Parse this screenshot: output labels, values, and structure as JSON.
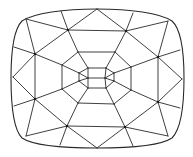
{
  "diagram": {
    "colors": {
      "line": "#2a2a2a",
      "background": "#ffffff"
    },
    "outline": {
      "path": "M 97 9 C 130 9 160 13 172 21 C 182 30 184 55 184 78 C 184 104 182 128 172 138 C 160 146 130 148 97 148 C 64 148 34 146 22 138 C 13 129 11 104 11 78 C 11 54 13 30 22 21 C 34 13 64 9 97 9 Z"
    },
    "nodes": [
      [
        68,
        30
      ],
      [
        126,
        31
      ],
      [
        35,
        54
      ],
      [
        158,
        57
      ],
      [
        35,
        99
      ],
      [
        158,
        102
      ],
      [
        67,
        126
      ],
      [
        125,
        127
      ]
    ],
    "edges": [
      [
        97,
        9,
        68,
        30
      ],
      [
        97,
        9,
        126,
        31
      ],
      [
        61,
        11,
        68,
        30
      ],
      [
        133,
        13,
        126,
        31
      ],
      [
        26,
        19,
        68,
        30
      ],
      [
        26,
        19,
        35,
        54
      ],
      [
        168,
        21,
        126,
        31
      ],
      [
        168,
        21,
        158,
        57
      ],
      [
        68,
        30,
        126,
        31
      ],
      [
        68,
        30,
        35,
        54
      ],
      [
        126,
        31,
        158,
        57
      ],
      [
        68,
        30,
        78,
        52
      ],
      [
        126,
        31,
        115,
        52
      ],
      [
        14,
        47,
        35,
        54
      ],
      [
        180,
        50,
        158,
        57
      ],
      [
        35,
        54,
        13,
        77
      ],
      [
        158,
        57,
        182,
        79
      ],
      [
        35,
        54,
        35,
        99
      ],
      [
        158,
        57,
        158,
        102
      ],
      [
        13,
        77,
        35,
        99
      ],
      [
        182,
        79,
        158,
        102
      ],
      [
        14,
        106,
        35,
        99
      ],
      [
        180,
        108,
        158,
        102
      ],
      [
        35,
        54,
        62,
        65
      ],
      [
        158,
        57,
        131,
        67
      ],
      [
        35,
        99,
        62,
        89
      ],
      [
        158,
        102,
        131,
        90
      ],
      [
        26,
        136,
        35,
        99
      ],
      [
        26,
        136,
        67,
        126
      ],
      [
        168,
        136,
        158,
        102
      ],
      [
        168,
        136,
        125,
        127
      ],
      [
        35,
        99,
        67,
        126
      ],
      [
        158,
        102,
        125,
        127
      ],
      [
        67,
        126,
        125,
        127
      ],
      [
        60,
        145,
        67,
        126
      ],
      [
        133,
        146,
        125,
        127
      ],
      [
        97,
        148,
        67,
        126
      ],
      [
        97,
        148,
        125,
        127
      ],
      [
        67,
        126,
        78,
        103
      ],
      [
        125,
        127,
        114,
        104
      ],
      [
        78,
        52,
        115,
        52
      ],
      [
        115,
        52,
        131,
        67
      ],
      [
        131,
        67,
        131,
        90
      ],
      [
        131,
        90,
        114,
        104
      ],
      [
        114,
        104,
        78,
        103
      ],
      [
        78,
        103,
        62,
        89
      ],
      [
        62,
        89,
        62,
        65
      ],
      [
        62,
        65,
        78,
        52
      ],
      [
        78,
        52,
        88,
        68
      ],
      [
        115,
        52,
        106,
        68
      ],
      [
        78,
        103,
        88,
        88
      ],
      [
        114,
        104,
        106,
        88
      ],
      [
        62,
        65,
        79,
        73
      ],
      [
        62,
        89,
        79,
        81
      ],
      [
        131,
        67,
        114,
        73
      ],
      [
        131,
        90,
        114,
        81
      ],
      [
        88,
        68,
        106,
        68
      ],
      [
        88,
        88,
        106,
        88
      ],
      [
        88,
        68,
        79,
        73
      ],
      [
        79,
        73,
        79,
        81
      ],
      [
        79,
        81,
        88,
        88
      ],
      [
        106,
        68,
        114,
        73
      ],
      [
        114,
        73,
        114,
        81
      ],
      [
        114,
        81,
        106,
        88
      ],
      [
        79,
        73,
        88,
        78
      ],
      [
        79,
        81,
        88,
        78
      ],
      [
        88,
        68,
        88,
        78
      ],
      [
        88,
        88,
        88,
        78
      ],
      [
        114,
        73,
        105,
        78
      ],
      [
        114,
        81,
        105,
        78
      ],
      [
        106,
        68,
        105,
        78
      ],
      [
        106,
        88,
        105,
        78
      ],
      [
        88,
        78,
        105,
        78
      ]
    ]
  }
}
